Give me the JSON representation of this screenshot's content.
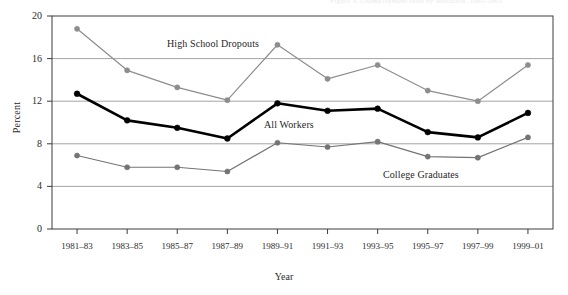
{
  "top_partial_text": "Figure 3. Unemployment rates by education, 1981-2001",
  "chart_data": {
    "type": "line",
    "title": "",
    "xlabel": "Year",
    "ylabel": "Percent",
    "ylim": [
      0,
      20
    ],
    "yticks": [
      0,
      4,
      8,
      12,
      16,
      20
    ],
    "grid": true,
    "legend_position": "inline-annotations",
    "categories": [
      "1981–83",
      "1983–85",
      "1985–87",
      "1987–89",
      "1989–91",
      "1991–93",
      "1993–95",
      "1995–97",
      "1997–99",
      "1999–01"
    ],
    "series": [
      {
        "name": "High School Dropouts",
        "color": "#8d8d8d",
        "values": [
          18.8,
          14.9,
          13.3,
          12.1,
          17.3,
          14.1,
          15.4,
          13.0,
          12.0,
          15.4
        ]
      },
      {
        "name": "All Workers",
        "color": "#000000",
        "values": [
          12.7,
          10.2,
          9.5,
          8.5,
          11.8,
          11.1,
          11.3,
          9.1,
          8.6,
          10.9
        ]
      },
      {
        "name": "College Graduates",
        "color": "#747474",
        "values": [
          6.9,
          5.8,
          5.8,
          5.4,
          8.1,
          7.7,
          8.2,
          6.8,
          6.7,
          8.6
        ]
      }
    ]
  },
  "annotations": [
    {
      "text": "High School Dropouts",
      "x": 167,
      "y": 38
    },
    {
      "text": "All Workers",
      "x": 264,
      "y": 119
    },
    {
      "text": "College Graduates",
      "x": 383,
      "y": 169
    }
  ],
  "colors": {
    "frame": "#3c3c3c",
    "gridline": "#9a9a9a",
    "dropouts": "#8d8d8d",
    "all_workers": "#000000",
    "college": "#747474",
    "background": "#ffffff"
  }
}
